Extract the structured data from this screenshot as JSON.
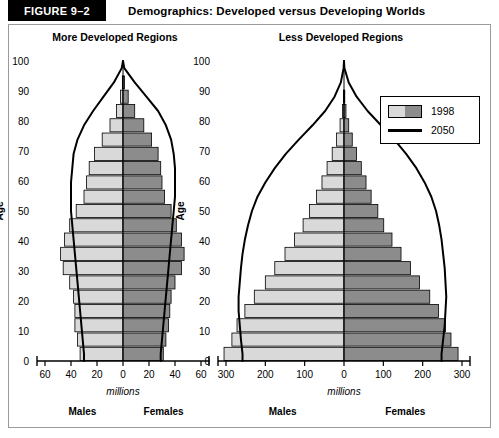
{
  "header": {
    "figure_tag": "FIGURE 9–2",
    "title": "Demographics: Developed versus Developing Worlds"
  },
  "legend": {
    "items": [
      {
        "label": "1998",
        "type": "bars",
        "color_male": "#d9d9d9",
        "color_female": "#8c8c8c"
      },
      {
        "label": "2050",
        "type": "line",
        "color": "#000000"
      }
    ]
  },
  "labels": {
    "age_axis": "Age",
    "x_axis": "millions",
    "males": "Males",
    "females": "Females"
  },
  "chart_data": [
    {
      "type": "bar",
      "title": "More Developed Regions",
      "orientation": "population-pyramid",
      "xlabel": "millions",
      "ylabel": "Age",
      "ylim": [
        0,
        100
      ],
      "xlim": [
        -60,
        60
      ],
      "xticks": [
        60,
        40,
        20,
        0,
        20,
        40,
        60
      ],
      "yticks": [
        0,
        10,
        20,
        30,
        40,
        50,
        60,
        70,
        80,
        90,
        100
      ],
      "grid": false,
      "legend_position": "none",
      "categories": [
        "0-4",
        "5-9",
        "10-14",
        "15-19",
        "20-24",
        "25-29",
        "30-34",
        "35-39",
        "40-44",
        "45-49",
        "50-54",
        "55-59",
        "60-64",
        "65-69",
        "70-74",
        "75-79",
        "80-84",
        "85-89",
        "90-94",
        "95-99",
        "100+"
      ],
      "series": [
        {
          "name": "1998 Males",
          "side": "left",
          "color": "#d9d9d9",
          "values": [
            33,
            35,
            37,
            37,
            38,
            41,
            46,
            48,
            45,
            41,
            36,
            30,
            28,
            26,
            22,
            16,
            10,
            5,
            2,
            0.5,
            0.1
          ]
        },
        {
          "name": "1998 Females",
          "side": "right",
          "color": "#8c8c8c",
          "values": [
            31,
            33,
            35,
            36,
            37,
            40,
            45,
            47,
            45,
            41,
            37,
            32,
            30,
            29,
            27,
            22,
            16,
            9,
            4,
            1.2,
            0.2
          ]
        },
        {
          "name": "2050 Males",
          "side": "left",
          "color": "#000000",
          "render": "outline",
          "values": [
            30,
            31,
            32,
            33,
            34,
            35,
            36,
            37,
            38,
            39,
            40,
            40,
            40,
            39,
            38,
            35,
            30,
            23,
            15,
            7,
            1
          ]
        },
        {
          "name": "2050 Females",
          "side": "right",
          "color": "#000000",
          "render": "outline",
          "values": [
            29,
            30,
            31,
            32,
            33,
            34,
            35,
            36,
            37,
            38,
            39,
            40,
            40,
            40,
            39,
            37,
            33,
            27,
            18,
            9,
            1
          ]
        }
      ]
    },
    {
      "type": "bar",
      "title": "Less Developed Regions",
      "orientation": "population-pyramid",
      "xlabel": "millions",
      "ylabel": "Age",
      "ylim": [
        0,
        100
      ],
      "xlim": [
        -300,
        300
      ],
      "xticks": [
        300,
        200,
        100,
        0,
        100,
        200,
        300
      ],
      "yticks": [
        0,
        10,
        20,
        30,
        40,
        50,
        60,
        70,
        80,
        90,
        100
      ],
      "grid": false,
      "legend_position": "top-right",
      "categories": [
        "0-4",
        "5-9",
        "10-14",
        "15-19",
        "20-24",
        "25-29",
        "30-34",
        "35-39",
        "40-44",
        "45-49",
        "50-54",
        "55-59",
        "60-64",
        "65-69",
        "70-74",
        "75-79",
        "80-84",
        "85-89",
        "90-94",
        "95-99",
        "100+"
      ],
      "series": [
        {
          "name": "1998 Males",
          "side": "left",
          "color": "#d9d9d9",
          "values": [
            305,
            285,
            272,
            252,
            228,
            200,
            176,
            150,
            126,
            104,
            88,
            70,
            56,
            43,
            30,
            19,
            10,
            4,
            1.5,
            0.4,
            0.1
          ]
        },
        {
          "name": "1998 Females",
          "side": "right",
          "color": "#8c8c8c",
          "values": [
            290,
            272,
            258,
            240,
            218,
            192,
            169,
            145,
            122,
            101,
            86,
            69,
            56,
            44,
            32,
            21,
            12,
            5,
            2,
            0.6,
            0.1
          ]
        },
        {
          "name": "2050 Males",
          "side": "left",
          "color": "#000000",
          "render": "outline",
          "values": [
            258,
            262,
            265,
            268,
            268,
            265,
            262,
            258,
            252,
            244,
            234,
            220,
            200,
            176,
            148,
            115,
            80,
            48,
            24,
            8,
            1
          ]
        },
        {
          "name": "2050 Females",
          "side": "right",
          "color": "#000000",
          "render": "outline",
          "values": [
            248,
            252,
            256,
            258,
            260,
            258,
            256,
            252,
            248,
            242,
            234,
            222,
            205,
            184,
            158,
            128,
            94,
            60,
            32,
            12,
            1
          ]
        }
      ]
    }
  ]
}
